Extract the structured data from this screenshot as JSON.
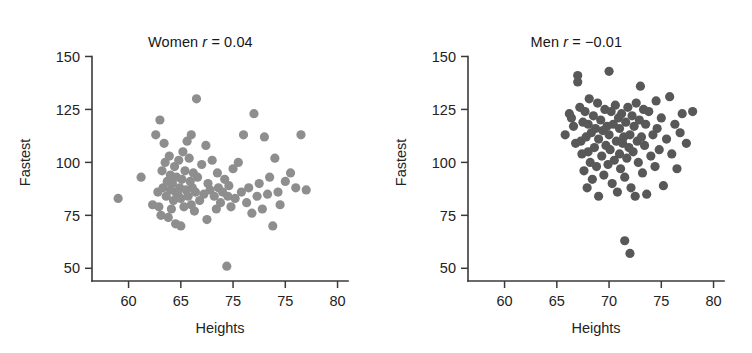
{
  "figure": {
    "background": "#ffffff",
    "axis_color": "#3a3a3a",
    "text_color": "#232323"
  },
  "chart_data": [
    {
      "type": "scatter",
      "title": "Women r = 0.04",
      "title_prefix": "Women ",
      "title_rsym": "r",
      "title_suffix": " = 0.04",
      "group": "Women",
      "correlation": 0.04,
      "xlabel": "Heights",
      "ylabel": "Fastest",
      "xlim": [
        56.5,
        81
      ],
      "ylim": [
        44,
        154
      ],
      "xticks": [
        60,
        65,
        70,
        75,
        80
      ],
      "xticklabels": [
        "60",
        "65",
        "75",
        "75",
        "80"
      ],
      "yticks": [
        50,
        75,
        100,
        125,
        150
      ],
      "yticklabels": [
        "50",
        "75",
        "100",
        "125",
        "150"
      ],
      "grid": false,
      "legend": null,
      "marker_color": "#8e8e8e",
      "marker_size": 4.6,
      "x": [
        59.0,
        61.2,
        62.3,
        62.6,
        62.8,
        62.9,
        63.0,
        63.1,
        63.2,
        63.3,
        63.4,
        63.5,
        63.6,
        63.7,
        63.8,
        63.9,
        64.0,
        64.0,
        64.1,
        64.2,
        64.3,
        64.4,
        64.5,
        64.5,
        64.6,
        64.7,
        64.8,
        64.9,
        65.0,
        65.0,
        65.1,
        65.2,
        65.3,
        65.4,
        65.5,
        65.6,
        65.7,
        65.8,
        65.9,
        66.0,
        66.0,
        66.1,
        66.2,
        66.3,
        66.4,
        66.5,
        66.6,
        66.8,
        67.0,
        67.2,
        67.4,
        67.5,
        67.6,
        67.8,
        68.0,
        68.2,
        68.4,
        68.5,
        68.6,
        68.8,
        69.0,
        69.2,
        69.4,
        69.5,
        69.6,
        69.8,
        70.0,
        70.2,
        70.5,
        70.8,
        71.0,
        71.3,
        71.5,
        71.8,
        72.0,
        72.3,
        72.5,
        72.8,
        73.0,
        73.3,
        73.5,
        73.8,
        74.0,
        74.3,
        74.5,
        75.0,
        75.5,
        76.0,
        76.5,
        77.0
      ],
      "y": [
        83.0,
        93.0,
        80.0,
        113.0,
        86.0,
        79.0,
        120.0,
        75.0,
        96.0,
        88.0,
        109.0,
        100.0,
        84.0,
        91.0,
        74.0,
        103.0,
        87.0,
        94.0,
        78.0,
        90.0,
        82.0,
        98.0,
        86.0,
        71.0,
        93.0,
        85.0,
        101.0,
        88.0,
        83.0,
        70.0,
        92.0,
        105.0,
        79.0,
        96.0,
        87.0,
        110.0,
        84.0,
        102.0,
        91.0,
        80.0,
        113.0,
        88.0,
        95.0,
        77.0,
        86.0,
        130.0,
        93.0,
        82.0,
        99.0,
        85.0,
        108.0,
        73.0,
        90.0,
        87.0,
        101.0,
        84.0,
        78.0,
        95.0,
        88.0,
        81.0,
        86.0,
        92.0,
        51.0,
        84.0,
        89.0,
        79.0,
        97.0,
        83.0,
        100.0,
        86.0,
        113.0,
        81.0,
        88.0,
        76.0,
        123.0,
        84.0,
        90.0,
        78.0,
        112.0,
        85.0,
        93.0,
        70.0,
        102.0,
        86.0,
        80.0,
        91.0,
        95.0,
        88.0,
        113.0,
        87.0
      ]
    },
    {
      "type": "scatter",
      "title": "Men r = -0.01",
      "title_prefix": "Men ",
      "title_rsym": "r",
      "title_suffix": " = −0.01",
      "group": "Men",
      "correlation": -0.01,
      "xlabel": "Heights",
      "ylabel": "Fastest",
      "xlim": [
        56.5,
        81
      ],
      "ylim": [
        44,
        154
      ],
      "xticks": [
        60,
        65,
        70,
        75,
        80
      ],
      "xticklabels": [
        "60",
        "65",
        "70",
        "75",
        "80"
      ],
      "yticks": [
        50,
        75,
        100,
        125,
        150
      ],
      "yticklabels": [
        "50",
        "75",
        "100",
        "125",
        "150"
      ],
      "grid": false,
      "legend": null,
      "marker_color": "#585858",
      "marker_size": 4.6,
      "x": [
        65.8,
        66.2,
        66.4,
        66.6,
        66.8,
        67.0,
        67.0,
        67.2,
        67.3,
        67.4,
        67.5,
        67.6,
        67.7,
        67.8,
        67.9,
        68.0,
        68.0,
        68.1,
        68.2,
        68.3,
        68.4,
        68.5,
        68.6,
        68.7,
        68.8,
        68.9,
        69.0,
        69.0,
        69.2,
        69.3,
        69.4,
        69.5,
        69.6,
        69.7,
        69.8,
        69.9,
        70.0,
        70.0,
        70.1,
        70.2,
        70.3,
        70.4,
        70.5,
        70.6,
        70.7,
        70.8,
        70.9,
        71.0,
        71.0,
        71.1,
        71.2,
        71.3,
        71.4,
        71.5,
        71.5,
        71.6,
        71.7,
        71.8,
        71.9,
        72.0,
        72.0,
        72.1,
        72.2,
        72.3,
        72.4,
        72.5,
        72.6,
        72.7,
        72.8,
        72.9,
        73.0,
        73.1,
        73.2,
        73.3,
        73.4,
        73.5,
        73.6,
        73.8,
        74.0,
        74.2,
        74.4,
        74.5,
        74.6,
        74.8,
        75.0,
        75.2,
        75.5,
        75.8,
        76.0,
        76.3,
        76.5,
        76.8,
        77.0,
        77.4,
        78.0
      ],
      "y": [
        113.0,
        123.0,
        121.0,
        117.0,
        109.0,
        141.0,
        138.0,
        126.0,
        110.0,
        104.0,
        119.0,
        96.0,
        124.0,
        112.0,
        88.0,
        118.0,
        105.0,
        130.0,
        100.0,
        114.0,
        92.0,
        122.0,
        107.0,
        116.0,
        98.0,
        128.0,
        111.0,
        84.0,
        120.0,
        103.0,
        115.0,
        94.0,
        125.0,
        108.0,
        117.0,
        99.0,
        143.0,
        113.0,
        106.0,
        124.0,
        90.0,
        118.0,
        101.0,
        127.0,
        110.0,
        86.0,
        121.0,
        104.0,
        116.0,
        97.0,
        123.0,
        109.0,
        112.0,
        63.0,
        93.0,
        119.0,
        102.0,
        126.0,
        107.0,
        57.0,
        113.0,
        88.0,
        122.0,
        105.0,
        117.0,
        84.0,
        128.0,
        110.0,
        100.0,
        120.0,
        136.0,
        112.0,
        95.0,
        125.0,
        108.0,
        118.0,
        85.0,
        124.0,
        103.0,
        113.0,
        98.0,
        129.0,
        116.0,
        106.0,
        121.0,
        89.0,
        111.0,
        131.0,
        104.0,
        118.0,
        97.0,
        114.0,
        123.0,
        109.0,
        124.0
      ]
    }
  ]
}
